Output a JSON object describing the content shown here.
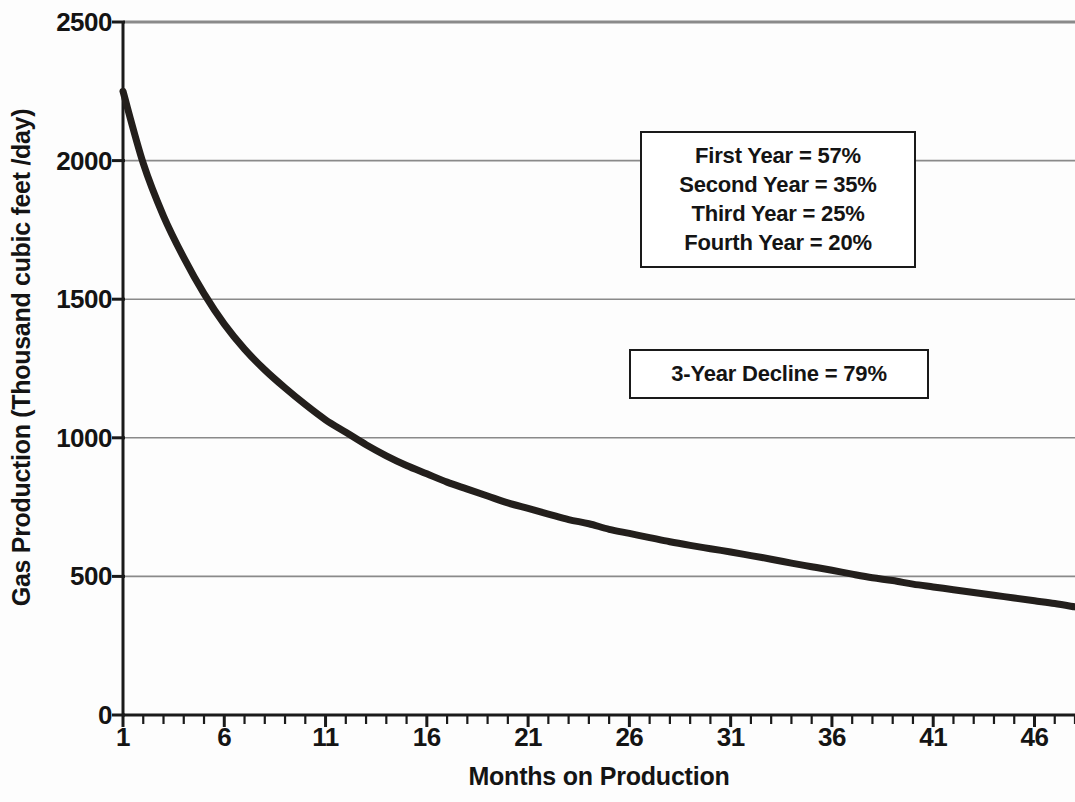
{
  "chart_data": {
    "type": "line",
    "title": "",
    "subtitle": "",
    "xlabel": "Months on Production",
    "ylabel": "Gas Production (Thousand cubic feet /day)",
    "xlim": [
      1,
      48
    ],
    "ylim": [
      0,
      2500
    ],
    "grid": "horizontal",
    "legend": "none",
    "series": [
      {
        "name": "Gas Production Decline",
        "color": "#231f1c",
        "x": [
          1,
          2,
          3,
          4,
          5,
          6,
          7,
          8,
          9,
          10,
          11,
          12,
          13,
          14,
          15,
          16,
          17,
          18,
          19,
          20,
          21,
          22,
          23,
          24,
          25,
          26,
          27,
          28,
          29,
          30,
          31,
          32,
          33,
          34,
          35,
          36,
          37,
          38,
          39,
          40,
          41,
          42,
          43,
          44,
          45,
          46,
          47,
          48
        ],
        "values": [
          2250,
          1990,
          1800,
          1650,
          1520,
          1410,
          1320,
          1245,
          1180,
          1120,
          1065,
          1020,
          975,
          935,
          900,
          870,
          840,
          815,
          790,
          765,
          745,
          725,
          705,
          690,
          670,
          655,
          640,
          625,
          612,
          600,
          588,
          575,
          562,
          548,
          535,
          522,
          508,
          495,
          485,
          472,
          462,
          452,
          442,
          432,
          422,
          412,
          402,
          390
        ]
      }
    ],
    "yticks": [
      0,
      500,
      1000,
      1500,
      2000,
      2500
    ],
    "ytick_labels": [
      "0",
      "500",
      "1000",
      "1500",
      "2000",
      "2500"
    ],
    "xticks": [
      1,
      6,
      11,
      16,
      21,
      26,
      31,
      36,
      41,
      46
    ],
    "xtick_labels": [
      "1",
      "6",
      "11",
      "16",
      "21",
      "26",
      "31",
      "36",
      "41",
      "46"
    ],
    "xminor_tick_step": 1,
    "annotations": [
      {
        "name": "decline-rates",
        "lines": [
          "First Year = 57%",
          "Second Year = 35%",
          "Third Year = 25%",
          "Fourth Year = 20%"
        ]
      },
      {
        "name": "three-year-decline",
        "lines": [
          "3-Year Decline = 79%"
        ]
      }
    ],
    "colors": {
      "curve": "#231f1c",
      "axis": "#1a1a1a",
      "gridline": "#8a8a8a",
      "text": "#141414",
      "background": "#fdfdfd"
    }
  }
}
